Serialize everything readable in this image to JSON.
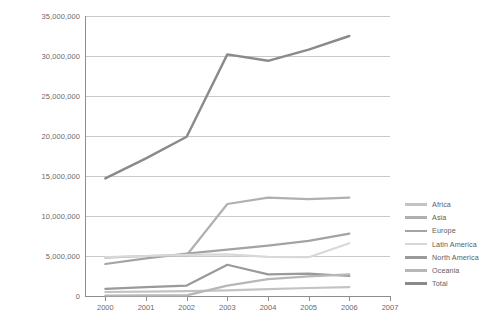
{
  "chart_data": {
    "type": "line",
    "title": "",
    "xlabel": "",
    "ylabel": "Hectares",
    "x": [
      2000,
      2001,
      2002,
      2003,
      2004,
      2005,
      2006
    ],
    "x_tick_labels": [
      "2000",
      "2001",
      "2002",
      "2003",
      "2004",
      "2005",
      "2006",
      "2007"
    ],
    "x_ticks": [
      2000,
      2001,
      2002,
      2003,
      2004,
      2005,
      2006,
      2007
    ],
    "xlim": [
      1999.5,
      2007.0
    ],
    "ylim": [
      0,
      35000000
    ],
    "y_ticks": [
      0,
      5000000,
      10000000,
      15000000,
      20000000,
      25000000,
      30000000,
      35000000
    ],
    "y_tick_labels": [
      "0",
      "5,000,000",
      "10,000,000",
      "15,000,000",
      "20,000,000",
      "25,000,000",
      "30,000,000",
      "35,000,000"
    ],
    "grid": true,
    "legend_position": "right",
    "series": [
      {
        "name": "Africa",
        "color": "#c3c3c3",
        "values": [
          500000,
          550000,
          600000,
          700000,
          850000,
          1000000,
          1100000
        ]
      },
      {
        "name": "Asia",
        "color": "#b0b0b0",
        "values": [
          4800000,
          5000000,
          5100000,
          11500000,
          12300000,
          12100000,
          12300000
        ]
      },
      {
        "name": "Europe",
        "color": "#a3a3a3",
        "values": [
          4000000,
          4700000,
          5300000,
          5800000,
          6300000,
          6900000,
          7800000
        ]
      },
      {
        "name": "Latin America",
        "color": "#d8d8d8",
        "values": [
          4850000,
          5000000,
          5150000,
          5200000,
          4900000,
          4850000,
          6600000
        ]
      },
      {
        "name": "North America",
        "color": "#9a9a9a",
        "values": [
          900000,
          1100000,
          1300000,
          3900000,
          2700000,
          2800000,
          2500000
        ]
      },
      {
        "name": "Oceania",
        "color": "#b7b7b7",
        "values": [
          60000,
          70000,
          80000,
          1300000,
          2100000,
          2450000,
          2700000
        ]
      },
      {
        "name": "Total",
        "color": "#8a8a8a",
        "values": [
          14700000,
          17200000,
          19900000,
          30200000,
          29400000,
          30800000,
          32500000
        ]
      }
    ]
  }
}
